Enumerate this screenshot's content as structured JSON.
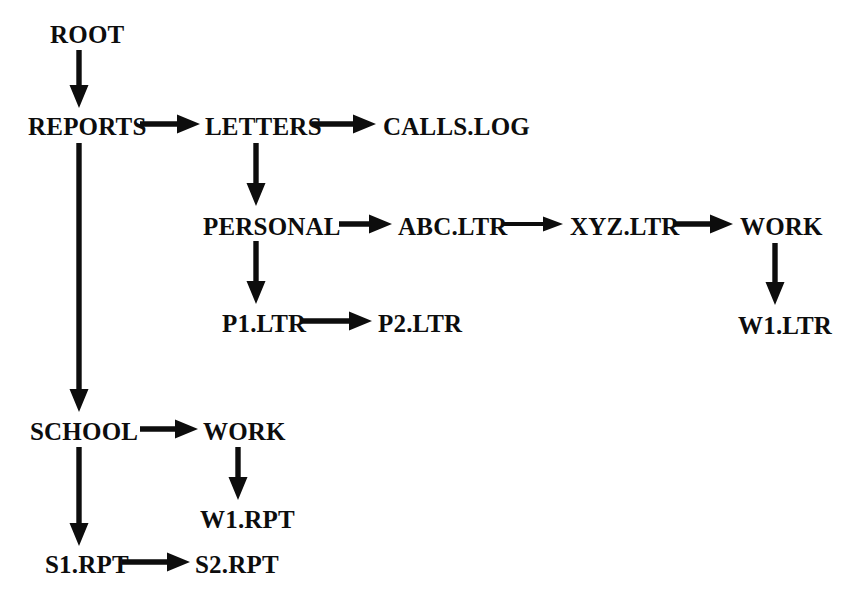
{
  "diagram": {
    "type": "tree",
    "title": "",
    "background_color": "#ffffff",
    "ink_color": "#0d0d0d",
    "nodes": [
      {
        "id": "root",
        "label": "ROOT",
        "x": 50,
        "y": 22,
        "level": 0
      },
      {
        "id": "reports",
        "label": "REPORTS",
        "x": 28,
        "y": 114,
        "level": 1
      },
      {
        "id": "letters",
        "label": "LETTERS",
        "x": 205,
        "y": 114,
        "level": 2
      },
      {
        "id": "callslog",
        "label": "CALLS.LOG",
        "x": 383,
        "y": 114,
        "level": 3
      },
      {
        "id": "personal",
        "label": "PERSONAL",
        "x": 203,
        "y": 214,
        "level": 3
      },
      {
        "id": "abcltr",
        "label": "ABC.LTR",
        "x": 398,
        "y": 214,
        "level": 4
      },
      {
        "id": "xyzltr",
        "label": "XYZ.LTR",
        "x": 570,
        "y": 214,
        "level": 5
      },
      {
        "id": "work_ltr",
        "label": "WORK",
        "x": 740,
        "y": 214,
        "level": 6
      },
      {
        "id": "p1ltr",
        "label": "P1.LTR",
        "x": 222,
        "y": 311,
        "level": 4
      },
      {
        "id": "p2ltr",
        "label": "P2.LTR",
        "x": 378,
        "y": 311,
        "level": 5
      },
      {
        "id": "w1ltr",
        "label": "W1.LTR",
        "x": 738,
        "y": 313,
        "level": 7
      },
      {
        "id": "school",
        "label": "SCHOOL",
        "x": 30,
        "y": 419,
        "level": 2
      },
      {
        "id": "work_rpt",
        "label": "WORK",
        "x": 203,
        "y": 419,
        "level": 3
      },
      {
        "id": "w1rpt",
        "label": "W1.RPT",
        "x": 200,
        "y": 507,
        "level": 4
      },
      {
        "id": "s1rpt",
        "label": "S1.RPT",
        "x": 45,
        "y": 552,
        "level": 3
      },
      {
        "id": "s2rpt",
        "label": "S2.RPT",
        "x": 195,
        "y": 552,
        "level": 4
      }
    ],
    "edges": [
      {
        "id": "e-root-reports",
        "from": "root",
        "to": "reports",
        "orientation": "vertical",
        "x1": 79,
        "y1": 50,
        "x2": 79,
        "y2": 108
      },
      {
        "id": "e-reports-letters",
        "from": "reports",
        "to": "letters",
        "orientation": "horizontal",
        "x1": 140,
        "y1": 124,
        "x2": 200,
        "y2": 124
      },
      {
        "id": "e-letters-calls",
        "from": "letters",
        "to": "callslog",
        "orientation": "horizontal",
        "x1": 312,
        "y1": 124,
        "x2": 376,
        "y2": 124
      },
      {
        "id": "e-letters-personal",
        "from": "letters",
        "to": "personal",
        "orientation": "vertical",
        "x1": 256,
        "y1": 143,
        "x2": 256,
        "y2": 206
      },
      {
        "id": "e-personal-abc",
        "from": "personal",
        "to": "abcltr",
        "orientation": "horizontal",
        "x1": 339,
        "y1": 224,
        "x2": 392,
        "y2": 224
      },
      {
        "id": "e-abc-xyz",
        "from": "abcltr",
        "to": "xyzltr",
        "orientation": "horizontal",
        "x1": 502,
        "y1": 224,
        "x2": 563,
        "y2": 224,
        "thin": true
      },
      {
        "id": "e-xyz-work",
        "from": "xyzltr",
        "to": "work_ltr",
        "orientation": "horizontal",
        "x1": 673,
        "y1": 224,
        "x2": 733,
        "y2": 224
      },
      {
        "id": "e-personal-p1",
        "from": "personal",
        "to": "p1ltr",
        "orientation": "vertical",
        "x1": 256,
        "y1": 241,
        "x2": 256,
        "y2": 304
      },
      {
        "id": "e-p1-p2",
        "from": "p1ltr",
        "to": "p2ltr",
        "orientation": "horizontal",
        "x1": 300,
        "y1": 321,
        "x2": 372,
        "y2": 321
      },
      {
        "id": "e-work-w1ltr",
        "from": "work_ltr",
        "to": "w1ltr",
        "orientation": "vertical",
        "x1": 775,
        "y1": 243,
        "x2": 775,
        "y2": 305
      },
      {
        "id": "e-reports-school",
        "from": "reports",
        "to": "school",
        "orientation": "vertical",
        "x1": 79,
        "y1": 143,
        "x2": 79,
        "y2": 412
      },
      {
        "id": "e-school-work",
        "from": "school",
        "to": "work_rpt",
        "orientation": "horizontal",
        "x1": 140,
        "y1": 429,
        "x2": 198,
        "y2": 429
      },
      {
        "id": "e-work-w1rpt",
        "from": "work_rpt",
        "to": "w1rpt",
        "orientation": "vertical",
        "x1": 238,
        "y1": 447,
        "x2": 238,
        "y2": 500
      },
      {
        "id": "e-school-s1",
        "from": "school",
        "to": "s1rpt",
        "orientation": "vertical",
        "x1": 79,
        "y1": 447,
        "x2": 79,
        "y2": 546
      },
      {
        "id": "e-s1-s2",
        "from": "s1rpt",
        "to": "s2rpt",
        "orientation": "horizontal",
        "x1": 122,
        "y1": 562,
        "x2": 190,
        "y2": 562
      }
    ]
  }
}
